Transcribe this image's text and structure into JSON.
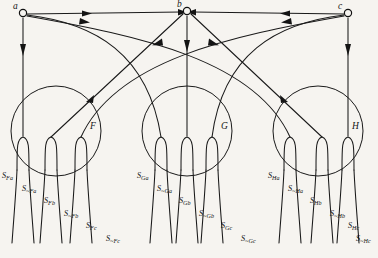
{
  "figure": {
    "background_color": "#f6f4f0",
    "ink_color": "#141414",
    "nodes": [
      {
        "id": "a",
        "label": "a",
        "x": 23,
        "y": 13
      },
      {
        "id": "b",
        "label": "b",
        "x": 187,
        "y": 11
      },
      {
        "id": "c",
        "label": "c",
        "x": 348,
        "y": 13
      }
    ],
    "circles": [
      {
        "id": "F",
        "label": "F",
        "cx": 56,
        "cy": 131,
        "r": 45
      },
      {
        "id": "G",
        "label": "G",
        "cx": 187,
        "cy": 131,
        "r": 45
      },
      {
        "id": "H",
        "label": "H",
        "cx": 318,
        "cy": 131,
        "r": 45
      }
    ],
    "groups": [
      {
        "id": "F",
        "signals": [
          {
            "text": "S",
            "sub": "Fa",
            "x": 2,
            "y": 172
          },
          {
            "text": "S",
            "sub": "~Fa",
            "x": 22,
            "y": 185
          },
          {
            "text": "S",
            "sub": "Fb",
            "x": 44,
            "y": 197
          },
          {
            "text": "S",
            "sub": "~Fb",
            "x": 64,
            "y": 210
          },
          {
            "text": "S",
            "sub": "Fc",
            "x": 86,
            "y": 222
          },
          {
            "text": "S",
            "sub": "~Fc",
            "x": 106,
            "y": 235
          }
        ]
      },
      {
        "id": "G",
        "signals": [
          {
            "text": "S",
            "sub": "Ga",
            "x": 137,
            "y": 172
          },
          {
            "text": "S",
            "sub": "~Ga",
            "x": 157,
            "y": 185
          },
          {
            "text": "S",
            "sub": "Gb",
            "x": 179,
            "y": 197
          },
          {
            "text": "S",
            "sub": "~Gb",
            "x": 199,
            "y": 210
          },
          {
            "text": "S",
            "sub": "Gc",
            "x": 221,
            "y": 222
          },
          {
            "text": "S",
            "sub": "~Gc",
            "x": 241,
            "y": 235
          }
        ]
      },
      {
        "id": "H",
        "signals": [
          {
            "text": "S",
            "sub": "Ha",
            "x": 268,
            "y": 172
          },
          {
            "text": "S",
            "sub": "~Ha",
            "x": 288,
            "y": 185
          },
          {
            "text": "S",
            "sub": "Hb",
            "x": 310,
            "y": 197
          },
          {
            "text": "S",
            "sub": "~Hb",
            "x": 330,
            "y": 210
          },
          {
            "text": "S",
            "sub": "Hc",
            "x": 348,
            "y": 222
          },
          {
            "text": "S",
            "sub": "~Hc",
            "x": 356,
            "y": 235
          }
        ]
      }
    ],
    "edges": [
      {
        "from": "a",
        "to": "F",
        "kind": "vertical"
      },
      {
        "from": "b",
        "to": "G",
        "kind": "vertical"
      },
      {
        "from": "c",
        "to": "H",
        "kind": "vertical"
      },
      {
        "from": "a",
        "to": "b",
        "kind": "straight"
      },
      {
        "from": "c",
        "to": "b",
        "kind": "straight"
      },
      {
        "from": "a",
        "to": "G",
        "kind": "arc"
      },
      {
        "from": "a",
        "to": "H",
        "kind": "arc"
      },
      {
        "from": "c",
        "to": "G",
        "kind": "arc"
      },
      {
        "from": "c",
        "to": "F",
        "kind": "arc"
      },
      {
        "from": "b",
        "to": "F",
        "kind": "arc"
      },
      {
        "from": "b",
        "to": "H",
        "kind": "arc"
      }
    ]
  }
}
